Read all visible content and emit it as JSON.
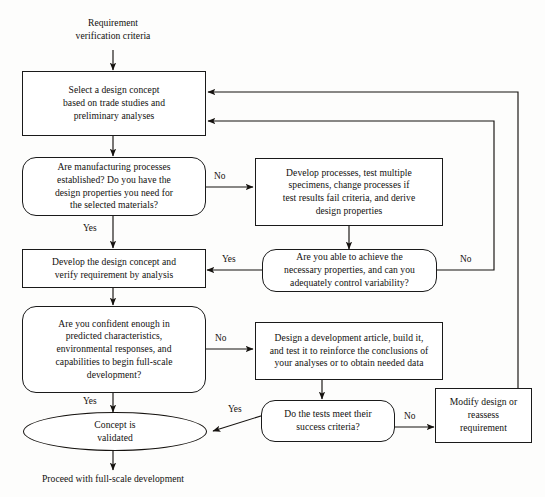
{
  "diagram": {
    "colors": {
      "stroke": "#1a1a1a",
      "text": "#12100e",
      "background": "#fdfdfc"
    },
    "nodes": {
      "start_label": "Requirement\nverification criteria",
      "select_concept": "Select a design concept\nbased on trade studies and\npreliminary analyses",
      "manufacturing_decision": "Are manufacturing processes\nestablished? Do you have the\ndesign properties you need for\nthe selected materials?",
      "develop_processes": "Develop processes, test multiple\nspecimens, change processes if\ntest results fail criteria, and derive\ndesign properties",
      "achieve_properties_decision": "Are you able to achieve the\nnecessary properties, and can you\nadequately control variability?",
      "develop_concept": "Develop the design concept and\nverify requirement by analysis",
      "confidence_decision": "Are you confident enough in\npredicted characteristics,\nenvironmental responses, and\ncapabilities to begin full-scale\ndevelopment?",
      "development_article": "Design a development article, build it,\nand test it to reinforce the conclusions of\nyour analyses or to obtain needed data",
      "tests_decision": "Do the tests meet their\nsuccess criteria?",
      "modify_design": "Modify design or\nreassess\nrequirement",
      "concept_validated": "Concept is\nvalidated",
      "end_label": "Proceed with full-scale development"
    },
    "edge_labels": {
      "manufacturing_no": "No",
      "manufacturing_yes": "Yes",
      "achieve_yes": "Yes",
      "achieve_no": "No",
      "confidence_no": "No",
      "confidence_yes": "Yes",
      "tests_no": "No",
      "tests_yes": "Yes"
    }
  }
}
